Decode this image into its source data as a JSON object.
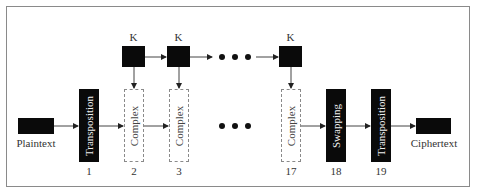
{
  "diagram": {
    "input": {
      "label": "Plaintext"
    },
    "output": {
      "label": "Ciphertext"
    },
    "key_label": "K",
    "ellipsis": "• • •",
    "stages": [
      {
        "id": "1",
        "label": "Transposition",
        "style": "solid",
        "number": "1"
      },
      {
        "id": "2",
        "label": "Complex",
        "style": "dashed",
        "number": "2"
      },
      {
        "id": "3",
        "label": "Complex",
        "style": "dashed",
        "number": "3"
      },
      {
        "id": "17",
        "label": "Complex",
        "style": "dashed",
        "number": "17"
      },
      {
        "id": "18",
        "label": "Swapping",
        "style": "solid",
        "number": "18"
      },
      {
        "id": "19",
        "label": "Transposition",
        "style": "solid",
        "number": "19"
      }
    ],
    "keys": [
      {
        "label": "K",
        "feeds_stage": "2"
      },
      {
        "label": "K",
        "feeds_stage": "3"
      },
      {
        "label": "K",
        "feeds_stage": "17"
      }
    ],
    "colors": {
      "block": "#0a0a0a",
      "dashed_border": "#8a8a8a",
      "arrow": "#333333"
    }
  }
}
